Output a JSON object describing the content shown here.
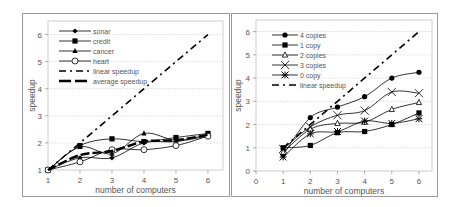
{
  "chart_data": [
    {
      "type": "line",
      "title": "",
      "xlabel": "number of computers",
      "ylabel": "speedup",
      "x": [
        1,
        2,
        3,
        4,
        5,
        6
      ],
      "xlim": [
        1,
        6.4
      ],
      "ylim": [
        1,
        6.5
      ],
      "xticks": [
        "1",
        "2",
        "3",
        "4",
        "5",
        "6"
      ],
      "yticks": [
        "1",
        "2",
        "3",
        "4",
        "5",
        "6"
      ],
      "grid": "horizontal",
      "legend_position": "upper-left",
      "series": [
        {
          "name": "sonar",
          "marker": "diamond",
          "values": [
            1.0,
            1.45,
            1.45,
            2.0,
            2.05,
            2.25
          ]
        },
        {
          "name": "credit",
          "marker": "square",
          "values": [
            1.0,
            1.9,
            2.15,
            2.05,
            2.2,
            2.35
          ]
        },
        {
          "name": "cancer",
          "marker": "triangle",
          "values": [
            1.0,
            1.85,
            1.6,
            2.35,
            2.1,
            2.3
          ]
        },
        {
          "name": "heart",
          "marker": "circle-open",
          "values": [
            1.0,
            1.3,
            1.75,
            1.75,
            1.9,
            2.25
          ]
        },
        {
          "name": "linear speedup",
          "style": "dash-dot",
          "values": [
            1,
            2,
            3,
            4,
            5,
            6
          ]
        },
        {
          "name": "average speedup",
          "style": "thick-dash",
          "values": [
            1.0,
            1.55,
            1.7,
            2.05,
            2.1,
            2.3
          ]
        }
      ]
    },
    {
      "type": "line",
      "title": "",
      "xlabel": "number of computers",
      "ylabel": "speedup",
      "x": [
        1,
        2,
        3,
        4,
        5,
        6
      ],
      "xlim": [
        0,
        6.5
      ],
      "ylim": [
        0,
        6.5
      ],
      "xticks": [
        "0",
        "1",
        "2",
        "3",
        "4",
        "5",
        "6"
      ],
      "yticks": [
        "0",
        "1",
        "2",
        "3",
        "4",
        "5",
        "6"
      ],
      "grid": "horizontal",
      "legend_position": "upper-left",
      "series": [
        {
          "name": "4 copies",
          "marker": "circle",
          "values": [
            0.7,
            2.3,
            2.75,
            3.2,
            4.0,
            4.25
          ]
        },
        {
          "name": "1 copy",
          "marker": "square",
          "values": [
            1.0,
            1.1,
            1.65,
            1.7,
            2.0,
            2.5
          ]
        },
        {
          "name": "2 copies",
          "marker": "triangle-open",
          "values": [
            0.8,
            1.8,
            2.05,
            2.1,
            2.65,
            2.95
          ]
        },
        {
          "name": "3 copies",
          "marker": "x",
          "values": [
            0.95,
            1.9,
            2.4,
            2.6,
            3.4,
            3.35
          ]
        },
        {
          "name": "0 copy",
          "marker": "star",
          "values": [
            0.6,
            1.6,
            1.7,
            2.15,
            2.05,
            2.25
          ]
        },
        {
          "name": "linear speedup",
          "style": "dash-dot",
          "values": [
            1,
            2,
            3,
            4,
            5,
            6
          ]
        }
      ]
    }
  ],
  "colors": {
    "line": "#000000",
    "grid": "#cccccc",
    "text": "#555555",
    "frame": "#9a9a9a"
  }
}
